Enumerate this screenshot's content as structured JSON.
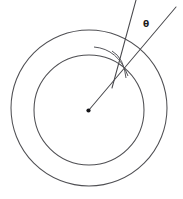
{
  "figure": {
    "type": "geometry-diagram",
    "canvas": {
      "width": 183,
      "height": 199,
      "background": "#ffffff"
    },
    "stroke_color": "#4f4f53",
    "label_color": "#1d1d20",
    "labels": {
      "angle": "θ"
    },
    "annotations": {
      "angle_label_x": 143,
      "angle_label_y": 20
    },
    "shapes": {
      "outer_circle": {
        "name": "outer-circle",
        "cx": 89,
        "cy": 108,
        "r": 78
      },
      "inner_circle": {
        "name": "inner-circle",
        "cx": 89,
        "cy": 110,
        "r": 55
      },
      "center_point": {
        "name": "center-point",
        "cx": 88.5,
        "cy": 110.5,
        "r": 2.1
      },
      "radial_ray": {
        "name": "radial-ray",
        "x1": 88.5,
        "y1": 110.5,
        "x2": 176,
        "y2": 7
      },
      "secondary_line": {
        "name": "secondary-line",
        "x1": 136,
        "y1": 0,
        "x2": 112,
        "y2": 88
      },
      "angle_arc": {
        "name": "angle-arc",
        "path": "M 94 47 Q 118 49 128 76"
      },
      "angle_arc_inner": {
        "name": "angle-arc-inner",
        "path": "M 112 51 Q 124 58 126 78"
      }
    }
  }
}
